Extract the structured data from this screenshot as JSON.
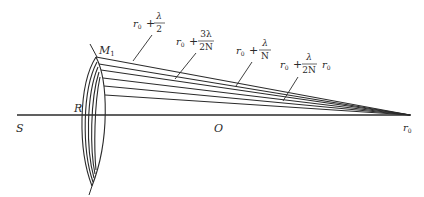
{
  "diagram": {
    "points": {
      "source": "S",
      "wavefront_vertex": "R",
      "center": "O",
      "observation": "r",
      "observation_sub": "0",
      "zone_edge": "M",
      "zone_edge_sub": "1"
    },
    "labels": [
      {
        "id": "half_wave",
        "base": "r",
        "sub": "0",
        "plus": "+",
        "num": "λ",
        "den": "2"
      },
      {
        "id": "three_half_n",
        "base": "r",
        "sub": "0",
        "plus": "+",
        "num": "3λ",
        "den": "2N"
      },
      {
        "id": "lambda_n",
        "base": "r",
        "sub": "0",
        "plus": "+",
        "num": "λ",
        "den": "N"
      },
      {
        "id": "half_n",
        "base": "r",
        "sub": "0",
        "plus": "+",
        "num": "λ",
        "den": "2N"
      },
      {
        "id": "r0_only",
        "base": "r",
        "sub": "0"
      }
    ],
    "colors": {
      "stroke": "#2b2b2b",
      "background": "#ffffff"
    }
  }
}
